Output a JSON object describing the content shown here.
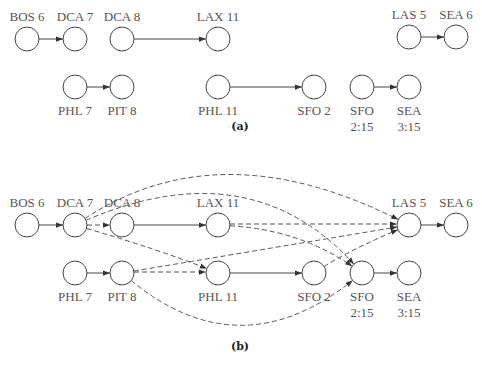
{
  "panels": [
    {
      "id": "a",
      "caption": "(a)",
      "caption_pos": [
        240,
        130
      ],
      "nodes": [
        {
          "id": "BOS6",
          "label": [
            "BOS 6"
          ],
          "x": 27,
          "y": 39,
          "label_pos": "above"
        },
        {
          "id": "DCA7",
          "label": [
            "DCA 7"
          ],
          "x": 75,
          "y": 39,
          "label_pos": "above"
        },
        {
          "id": "DCA8",
          "label": [
            "DCA 8"
          ],
          "x": 122,
          "y": 39,
          "label_pos": "above"
        },
        {
          "id": "LAX11",
          "label": [
            "LAX 11"
          ],
          "x": 218,
          "y": 39,
          "label_pos": "above"
        },
        {
          "id": "LAS5",
          "label": [
            "LAS 5"
          ],
          "x": 409,
          "y": 37,
          "label_pos": "above"
        },
        {
          "id": "SEA6",
          "label": [
            "SEA 6"
          ],
          "x": 456,
          "y": 37,
          "label_pos": "above"
        },
        {
          "id": "PHL7",
          "label": [
            "PHL 7"
          ],
          "x": 75,
          "y": 87,
          "label_pos": "below"
        },
        {
          "id": "PIT8",
          "label": [
            "PIT 8"
          ],
          "x": 122,
          "y": 87,
          "label_pos": "below"
        },
        {
          "id": "PHL11",
          "label": [
            "PHL 11"
          ],
          "x": 218,
          "y": 87,
          "label_pos": "below"
        },
        {
          "id": "SFO2",
          "label": [
            "SFO 2"
          ],
          "x": 314,
          "y": 87,
          "label_pos": "below"
        },
        {
          "id": "SFO215",
          "label": [
            "SFO",
            "2:15"
          ],
          "x": 362,
          "y": 87,
          "label_pos": "below"
        },
        {
          "id": "SEA315",
          "label": [
            "SEA",
            "3:15"
          ],
          "x": 409,
          "y": 87,
          "label_pos": "below"
        }
      ],
      "edges": [
        {
          "from": "BOS6",
          "to": "DCA7",
          "style": "solid"
        },
        {
          "from": "DCA8",
          "to": "LAX11",
          "style": "solid"
        },
        {
          "from": "LAS5",
          "to": "SEA6",
          "style": "solid"
        },
        {
          "from": "PHL7",
          "to": "PIT8",
          "style": "solid"
        },
        {
          "from": "PHL11",
          "to": "SFO2",
          "style": "solid"
        },
        {
          "from": "SFO215",
          "to": "SEA315",
          "style": "solid"
        }
      ]
    },
    {
      "id": "b",
      "caption": "(b)",
      "caption_pos": [
        240,
        350
      ],
      "nodes": [
        {
          "id": "BOS6",
          "label": [
            "BOS 6"
          ],
          "x": 27,
          "y": 225,
          "label_pos": "above"
        },
        {
          "id": "DCA7",
          "label": [
            "DCA 7"
          ],
          "x": 75,
          "y": 225,
          "label_pos": "above"
        },
        {
          "id": "DCA8",
          "label": [
            "DCA 8"
          ],
          "x": 122,
          "y": 225,
          "label_pos": "above"
        },
        {
          "id": "LAX11",
          "label": [
            "LAX 11"
          ],
          "x": 218,
          "y": 225,
          "label_pos": "above"
        },
        {
          "id": "LAS5",
          "label": [
            "LAS 5"
          ],
          "x": 409,
          "y": 225,
          "label_pos": "above"
        },
        {
          "id": "SEA6",
          "label": [
            "SEA 6"
          ],
          "x": 456,
          "y": 225,
          "label_pos": "above"
        },
        {
          "id": "PHL7",
          "label": [
            "PHL 7"
          ],
          "x": 75,
          "y": 273,
          "label_pos": "below"
        },
        {
          "id": "PIT8",
          "label": [
            "PIT 8"
          ],
          "x": 122,
          "y": 273,
          "label_pos": "below"
        },
        {
          "id": "PHL11",
          "label": [
            "PHL 11"
          ],
          "x": 218,
          "y": 273,
          "label_pos": "below"
        },
        {
          "id": "SFO2",
          "label": [
            "SFO 2"
          ],
          "x": 314,
          "y": 273,
          "label_pos": "below"
        },
        {
          "id": "SFO215",
          "label": [
            "SFO",
            "2:15"
          ],
          "x": 362,
          "y": 273,
          "label_pos": "below"
        },
        {
          "id": "SEA315",
          "label": [
            "SEA",
            "3:15"
          ],
          "x": 409,
          "y": 273,
          "label_pos": "below"
        }
      ],
      "edges": [
        {
          "from": "BOS6",
          "to": "DCA7",
          "style": "solid"
        },
        {
          "from": "DCA8",
          "to": "LAX11",
          "style": "solid"
        },
        {
          "from": "LAS5",
          "to": "SEA6",
          "style": "solid"
        },
        {
          "from": "PHL7",
          "to": "PIT8",
          "style": "solid"
        },
        {
          "from": "PHL11",
          "to": "SFO2",
          "style": "solid"
        },
        {
          "from": "SFO215",
          "to": "SEA315",
          "style": "solid"
        },
        {
          "from": "DCA7",
          "to": "DCA8",
          "style": "dashed"
        },
        {
          "from": "DCA7",
          "to": "PHL11",
          "style": "dashed",
          "curve": [
            160,
            250
          ]
        },
        {
          "from": "DCA7",
          "to": "LAS5",
          "style": "dashed",
          "curve": [
            220,
            130
          ]
        },
        {
          "from": "DCA7",
          "to": "SFO215",
          "style": "dashed",
          "curve": [
            250,
            150
          ]
        },
        {
          "from": "LAX11",
          "to": "LAS5",
          "style": "dashed",
          "offset": -1
        },
        {
          "from": "LAX11",
          "to": "SFO215",
          "style": "dashed",
          "curve": [
            300,
            230
          ]
        },
        {
          "from": "PIT8",
          "to": "PHL11",
          "style": "dashed",
          "offset": -1
        },
        {
          "from": "PIT8",
          "to": "LAS5",
          "style": "dashed",
          "curve": [
            260,
            250
          ]
        },
        {
          "from": "PIT8",
          "to": "SFO215",
          "style": "dashed",
          "curve": [
            240,
            370
          ]
        },
        {
          "from": "SFO2",
          "to": "LAS5",
          "style": "dashed",
          "curve": [
            350,
            250
          ]
        }
      ]
    }
  ],
  "node_radius": 12
}
